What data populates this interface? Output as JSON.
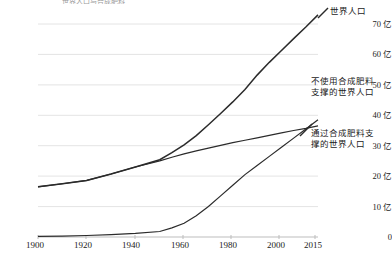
{
  "chart_data": {
    "type": "line",
    "title": "世界人口与合成肥料",
    "xlabel": "",
    "ylabel": "",
    "xlim": [
      1900,
      2015
    ],
    "ylim": [
      0,
      75
    ],
    "grid": true,
    "legend_position": "right-inline-annotations",
    "y_unit": "亿",
    "y_ticks": [
      0,
      10,
      20,
      30,
      40,
      50,
      60,
      70
    ],
    "y_tick_labels": [
      "0",
      "10 亿",
      "20 亿",
      "30 亿",
      "40 亿",
      "50 亿",
      "60 亿",
      "70 亿"
    ],
    "x_ticks": [
      1900,
      1920,
      1940,
      1960,
      1980,
      2000,
      2015
    ],
    "x_tick_labels": [
      "1900",
      "1920",
      "1940",
      "1960",
      "1980",
      "2000",
      "2015"
    ],
    "x": [
      1900,
      1910,
      1920,
      1930,
      1940,
      1950,
      1955,
      1960,
      1965,
      1970,
      1975,
      1980,
      1985,
      1990,
      1995,
      2000,
      2005,
      2010,
      2015
    ],
    "series": [
      {
        "name": "世界人口",
        "color": "#2b2b2b",
        "values": [
          16.5,
          17.5,
          18.6,
          20.7,
          23.0,
          25.4,
          27.7,
          30.3,
          33.3,
          36.9,
          40.6,
          44.4,
          48.5,
          53.2,
          57.4,
          61.3,
          65.2,
          69.0,
          73.0
        ]
      },
      {
        "name": "不使用合成肥料支撑的世界人口",
        "color": "#2b2b2b",
        "values": [
          16.5,
          17.5,
          18.6,
          20.7,
          23.0,
          25.0,
          26.2,
          27.3,
          28.3,
          29.2,
          30.1,
          31.0,
          31.8,
          32.6,
          33.4,
          34.2,
          35.0,
          35.7,
          36.5
        ]
      },
      {
        "name": "通过合成肥料支撑的世界人口",
        "color": "#2b2b2b",
        "values": [
          0.2,
          0.3,
          0.5,
          0.8,
          1.2,
          1.8,
          3.0,
          4.5,
          7.0,
          10.0,
          13.5,
          17.0,
          20.5,
          23.5,
          26.5,
          29.5,
          32.5,
          35.5,
          38.5
        ]
      }
    ],
    "annotations": [
      {
        "id": "annot-world-population",
        "text": "世界人口",
        "x_px": 330,
        "y_px": 6,
        "leader": {
          "x1": 318,
          "y1": 18,
          "x2": 328,
          "y2": 8
        }
      },
      {
        "id": "annot-without-fertilizer",
        "text": "不使用合成肥料\n支撑的世界人口",
        "x_px": 311,
        "y_px": 76,
        "leader": null
      },
      {
        "id": "annot-with-fertilizer",
        "text": "通过合成肥料支\n撑的世界人口",
        "x_px": 311,
        "y_px": 128,
        "leader": {
          "x1": 300,
          "y1": 136,
          "x2": 312,
          "y2": 124
        }
      }
    ]
  },
  "colors": {
    "line": "#2b2b2b",
    "grid": "#e4e4e4",
    "axis": "#bdbdbd",
    "text": "#1a1a1a"
  }
}
